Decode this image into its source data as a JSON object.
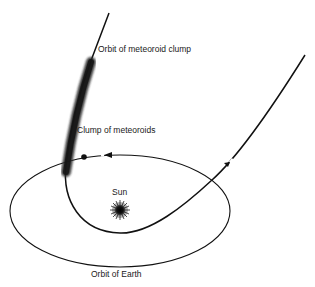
{
  "diagram": {
    "labels": {
      "orbit_clump": "Orbit of meteoroid clump",
      "clump": "Clump of meteoroids",
      "sun": "Sun",
      "earth_orbit": "Orbit of Earth"
    },
    "elements": {
      "earth_orbit": "ellipse",
      "sun": "starburst",
      "meteoroid_orbit": "parabolic-path",
      "clump": "shaded-band",
      "earth": "dot",
      "direction_arrows": 2
    },
    "colors": {
      "line": "#111111",
      "clump": "#2a2a2a",
      "background": "#ffffff"
    }
  }
}
